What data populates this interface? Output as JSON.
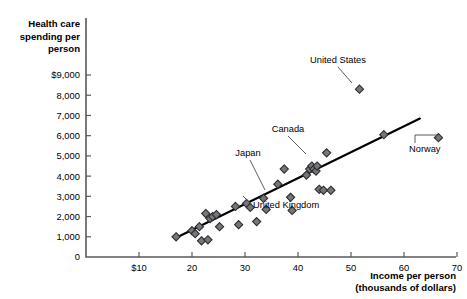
{
  "chart_data": {
    "type": "scatter",
    "title": "",
    "ylabel": "Health care spending per person",
    "xlabel": "Income per person (thousands of dollars)",
    "xlabel_line1": "Income per person",
    "xlabel_line2": "(thousands of dollars)",
    "ylabel_line1": "Health care",
    "ylabel_line2": "spending per",
    "ylabel_line3": "person",
    "xlim": [
      0,
      70
    ],
    "ylim": [
      0,
      9000
    ],
    "grid": false,
    "legend": "none",
    "x_ticks": [
      {
        "value": 10,
        "label": "$10"
      },
      {
        "value": 20,
        "label": "20"
      },
      {
        "value": 30,
        "label": "30"
      },
      {
        "value": 40,
        "label": "40"
      },
      {
        "value": 50,
        "label": "50"
      },
      {
        "value": 60,
        "label": "60"
      },
      {
        "value": 70,
        "label": "70"
      }
    ],
    "y_ticks": [
      {
        "value": 0,
        "label": "0"
      },
      {
        "value": 1000,
        "label": "1,000"
      },
      {
        "value": 2000,
        "label": "2,000"
      },
      {
        "value": 3000,
        "label": "3,000"
      },
      {
        "value": 4000,
        "label": "4,000"
      },
      {
        "value": 5000,
        "label": "5,000"
      },
      {
        "value": 6000,
        "label": "6,000"
      },
      {
        "value": 7000,
        "label": "7,000"
      },
      {
        "value": 8000,
        "label": "8,000"
      },
      {
        "value": 9000,
        "label": "$9,000"
      }
    ],
    "trend_line": {
      "x1": 17.0,
      "y1": 950,
      "x2": 63.0,
      "y2": 6850
    },
    "points": [
      {
        "x": 17.0,
        "y": 1000
      },
      {
        "x": 20.0,
        "y": 1300
      },
      {
        "x": 20.6,
        "y": 1150
      },
      {
        "x": 21.4,
        "y": 1500
      },
      {
        "x": 21.8,
        "y": 800
      },
      {
        "x": 23.0,
        "y": 850
      },
      {
        "x": 22.6,
        "y": 2150
      },
      {
        "x": 23.4,
        "y": 1900
      },
      {
        "x": 23.9,
        "y": 2000
      },
      {
        "x": 24.6,
        "y": 2100
      },
      {
        "x": 25.2,
        "y": 1500
      },
      {
        "x": 28.2,
        "y": 2500
      },
      {
        "x": 28.8,
        "y": 1600
      },
      {
        "x": 30.3,
        "y": 2650
      },
      {
        "x": 31.0,
        "y": 2450
      },
      {
        "x": 32.2,
        "y": 1750
      },
      {
        "x": 33.5,
        "y": 2900
      },
      {
        "x": 34.0,
        "y": 2350
      },
      {
        "x": 36.2,
        "y": 3600
      },
      {
        "x": 37.4,
        "y": 4350
      },
      {
        "x": 38.6,
        "y": 2950
      },
      {
        "x": 38.9,
        "y": 2300
      },
      {
        "x": 41.6,
        "y": 4050
      },
      {
        "x": 42.2,
        "y": 4350
      },
      {
        "x": 42.6,
        "y": 4500
      },
      {
        "x": 43.0,
        "y": 4350
      },
      {
        "x": 43.4,
        "y": 4250
      },
      {
        "x": 43.6,
        "y": 4500
      },
      {
        "x": 44.0,
        "y": 3350
      },
      {
        "x": 44.8,
        "y": 3300
      },
      {
        "x": 45.4,
        "y": 5150
      },
      {
        "x": 46.2,
        "y": 3300
      },
      {
        "x": 51.6,
        "y": 8300
      },
      {
        "x": 56.2,
        "y": 6050
      },
      {
        "x": 66.5,
        "y": 5900
      }
    ],
    "annotations": [
      {
        "label": "United States",
        "anchor": "middle",
        "text_x": 338,
        "text_y": 63,
        "leader": [
          [
            338,
            67
          ],
          [
            352,
            83
          ]
        ]
      },
      {
        "label": "Canada",
        "anchor": "middle",
        "text_x": 288,
        "text_y": 132,
        "leader": [
          [
            288,
            136
          ],
          [
            306,
            154
          ]
        ]
      },
      {
        "label": "Japan",
        "anchor": "middle",
        "text_x": 248,
        "text_y": 156,
        "leader": [
          [
            250,
            160
          ],
          [
            265,
            190
          ]
        ]
      },
      {
        "label": "United Kingdom",
        "anchor": "start",
        "text_x": 253,
        "text_y": 208,
        "leader": [
          [
            252,
            205
          ],
          [
            243,
            196
          ]
        ]
      },
      {
        "label": "Norway",
        "anchor": "start",
        "text_x": 409,
        "text_y": 152,
        "leader": [
          [
            415,
            143
          ],
          [
            415,
            135
          ],
          [
            437,
            135
          ]
        ]
      }
    ]
  }
}
